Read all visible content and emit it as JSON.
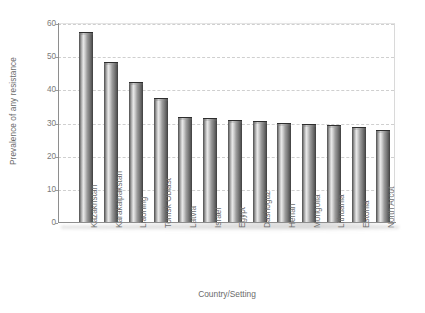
{
  "chart_data": {
    "type": "bar",
    "title": "",
    "xlabel": "Country/Setting",
    "ylabel": "Prevalence of any resistance",
    "ylim": [
      0,
      60
    ],
    "yticks": [
      0,
      10,
      20,
      30,
      40,
      50,
      60
    ],
    "grid": true,
    "legend_position": "none",
    "categories": [
      "Kazakhstan",
      "Karakalpakstan",
      "Liaoning",
      "Tomsk Oblast",
      "Latvia",
      "Israel",
      "Egypt",
      "Dashoguz",
      "Henan",
      "Mongolia",
      "Lithuania",
      "Estonia",
      "North Arcot"
    ],
    "values": [
      57.5,
      48.5,
      42.5,
      37.8,
      32.0,
      31.7,
      31.0,
      30.8,
      30.3,
      30.0,
      29.5,
      29.0,
      28.0
    ]
  },
  "style": {
    "bar_dark": "#3d3d3d",
    "bar_light": "#e8e8e8",
    "axis_color": "#8e8e8e",
    "grid_color": "#cfcfcf",
    "text_color": "#6b6b6b",
    "background": "#ffffff"
  }
}
